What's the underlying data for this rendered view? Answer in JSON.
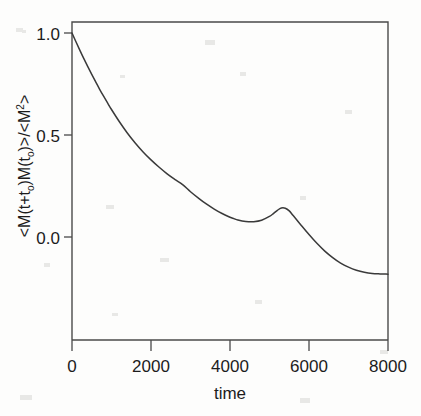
{
  "figure": {
    "background_color": "#fdfdfc",
    "curve_color": "#3a3a3a",
    "axis_color": "#4a4a4a"
  },
  "axes": {
    "x_title": "time",
    "y_title_parts": {
      "p1": "<M(t+t",
      "sub1": "o",
      "p2": ")M(t",
      "sub2": "o",
      "p3": ")>/<M",
      "sup1": "2",
      "p4": ">"
    },
    "y_title_plain": "<M(t+to)M(to)>/<M2>",
    "x_ticks": [
      "0",
      "2000",
      "4000",
      "6000",
      "8000"
    ],
    "y_ticks": [
      "1.0",
      "0.5",
      "0.0"
    ]
  },
  "chart_data": {
    "type": "line",
    "title": "",
    "xlabel": "time",
    "ylabel": "<M(t+t_o)M(t_o)>/<M^2>",
    "xlim": [
      0,
      8000
    ],
    "ylim": [
      -0.32,
      1.05
    ],
    "xticks": [
      0,
      2000,
      4000,
      6000,
      8000
    ],
    "yticks": [
      0.0,
      0.5,
      1.0
    ],
    "grid": false,
    "legend": null,
    "series": [
      {
        "name": "magnetization autocorrelation",
        "x": [
          0,
          100,
          200,
          300,
          400,
          500,
          600,
          700,
          800,
          900,
          1000,
          1200,
          1400,
          1600,
          1800,
          2000,
          2200,
          2400,
          2600,
          2800,
          3000,
          3200,
          3400,
          3600,
          3800,
          4000,
          4100,
          4200,
          4400,
          4600,
          4800,
          5000,
          5100,
          5200,
          5300,
          5400,
          5500,
          5600,
          5800,
          6000,
          6200,
          6400,
          6600,
          6800,
          7000,
          7200,
          7400,
          7600,
          7800,
          8000
        ],
        "y": [
          1.0,
          0.957,
          0.915,
          0.874,
          0.835,
          0.797,
          0.76,
          0.724,
          0.69,
          0.657,
          0.625,
          0.565,
          0.51,
          0.461,
          0.417,
          0.378,
          0.343,
          0.311,
          0.283,
          0.257,
          0.222,
          0.191,
          0.162,
          0.137,
          0.115,
          0.097,
          0.09,
          0.083,
          0.076,
          0.075,
          0.082,
          0.101,
          0.115,
          0.131,
          0.142,
          0.141,
          0.128,
          0.105,
          0.058,
          0.012,
          -0.031,
          -0.069,
          -0.101,
          -0.128,
          -0.148,
          -0.163,
          -0.173,
          -0.179,
          -0.181,
          -0.182
        ]
      }
    ],
    "annotations": []
  }
}
